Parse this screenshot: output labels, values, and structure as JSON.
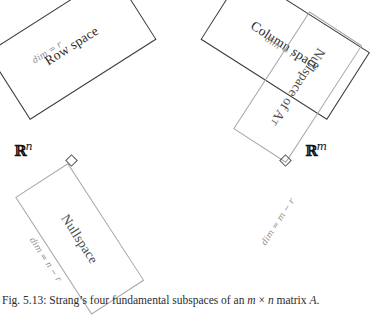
{
  "figure": {
    "caption_prefix": "Fig. 5.13:",
    "caption_text_1": " Strang’s four fundamental subspaces of an ",
    "caption_m": "m",
    "caption_times": " × ",
    "caption_n": "n",
    "caption_text_2": " matrix ",
    "caption_a": "A",
    "caption_end": "."
  },
  "domains": {
    "left_label_symbol": "ℝ",
    "left_label_exponent": "n",
    "right_label_symbol": "ℝ",
    "right_label_exponent": "m"
  },
  "subspaces": [
    {
      "id": "row-space",
      "name": "Row space",
      "dim_label": "dim = r",
      "frame_color": "#3b3b3b",
      "side": "left",
      "position": "upper"
    },
    {
      "id": "nullspace",
      "name": "Nullspace",
      "dim_label": "dim = n − r",
      "frame_color": "#a8a8a8",
      "side": "left",
      "position": "lower"
    },
    {
      "id": "column-space",
      "name": "Column space",
      "dim_label": "dim = r",
      "frame_color": "#3b3b3b",
      "side": "right",
      "position": "upper"
    },
    {
      "id": "nullspace-of-a-transpose",
      "name": "Nullspace of A",
      "name_superscript": "T",
      "dim_label": "dim = m − r",
      "frame_color": "#a8a8a8",
      "side": "right",
      "position": "lower"
    }
  ]
}
